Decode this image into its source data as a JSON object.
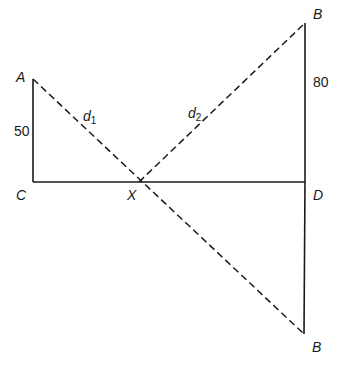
{
  "diagram": {
    "colors": {
      "line": "#1a1a1a",
      "background": "#ffffff"
    },
    "points": {
      "A": {
        "label": "A",
        "x": 33,
        "y": 79
      },
      "C": {
        "label": "C",
        "x": 33,
        "y": 182
      },
      "X": {
        "label": "X",
        "x": 139,
        "y": 182
      },
      "D": {
        "label": "D",
        "x": 305,
        "y": 182
      },
      "B_top": {
        "label": "B",
        "x": 305,
        "y": 23
      },
      "B_bottom": {
        "label": "B",
        "x": 304,
        "y": 334
      }
    },
    "lengths": {
      "AC": "50",
      "BD": "80"
    },
    "distances": {
      "d1": {
        "base": "d",
        "sub": "1"
      },
      "d2": {
        "base": "d",
        "sub": "2"
      }
    }
  }
}
